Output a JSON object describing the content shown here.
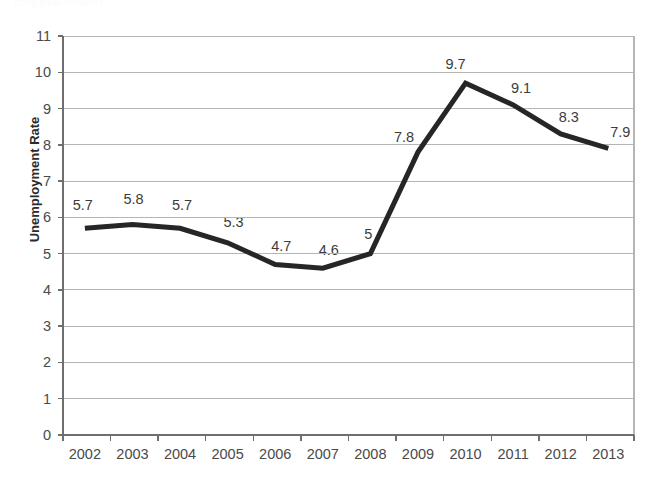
{
  "top_fragment": "cropped-header",
  "chart_data": {
    "type": "line",
    "title": "",
    "xlabel": "",
    "ylabel": "Unemployment Rate",
    "categories": [
      "2002",
      "2003",
      "2004",
      "2005",
      "2006",
      "2007",
      "2008",
      "2009",
      "2010",
      "2011",
      "2012",
      "2013"
    ],
    "values": [
      5.7,
      5.8,
      5.7,
      5.3,
      4.7,
      4.6,
      5,
      7.8,
      9.7,
      9.1,
      8.3,
      7.9
    ],
    "point_labels": [
      "5.7",
      "5.8",
      "5.7",
      "5.3",
      "4.7",
      "4.6",
      "5",
      "7.8",
      "9.7",
      "9.1",
      "8.3",
      "7.9"
    ],
    "ylim": [
      0,
      11
    ],
    "ytick_labels": [
      "11",
      "10",
      "9",
      "8",
      "7",
      "6",
      "5",
      "4",
      "3",
      "2",
      "1",
      "0"
    ],
    "ytick_values": [
      11,
      10,
      9,
      8,
      7,
      6,
      5,
      4,
      3,
      2,
      1,
      0
    ],
    "grid": true,
    "grid_axis": "y",
    "legend": false,
    "legend_position": "none",
    "series_color": "#262626",
    "grid_color": "#b5b5b5",
    "axis_color": "#6e6e6e",
    "line_width": 5
  }
}
